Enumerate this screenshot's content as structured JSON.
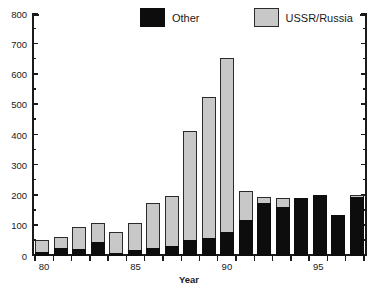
{
  "chart_data": {
    "type": "bar",
    "stacked": true,
    "title": "",
    "subtitle": "",
    "xlabel": "Year",
    "ylabel": "",
    "ylim": [
      0,
      800
    ],
    "ytick_step": 100,
    "yminor_step": 50,
    "grid": false,
    "legend_position": "top-center",
    "categories": [
      "80",
      "81",
      "82",
      "83",
      "84",
      "85",
      "86",
      "87",
      "88",
      "89",
      "90",
      "91",
      "92",
      "93",
      "94",
      "95",
      "96",
      "97"
    ],
    "xtick_labels": [
      "80",
      "85",
      "90",
      "95"
    ],
    "ytick_labels": [
      "0",
      "100",
      "200",
      "300",
      "400",
      "500",
      "600",
      "700",
      "800"
    ],
    "series": [
      {
        "name": "Other",
        "color": "#0d0d0d",
        "values": [
          12,
          27,
          22,
          47,
          10,
          20,
          26,
          32,
          53,
          58,
          81,
          118,
          175,
          163,
          193,
          203,
          135,
          196
        ]
      },
      {
        "name": "USSR/Russia",
        "color": "#c8c8c8",
        "values": [
          40,
          37,
          75,
          63,
          68,
          89,
          149,
          168,
          360,
          467,
          575,
          98,
          20,
          28,
          0,
          0,
          0,
          3
        ]
      }
    ],
    "totals": [
      52,
      64,
      97,
      110,
      78,
      109,
      175,
      200,
      413,
      525,
      656,
      216,
      195,
      191,
      193,
      203,
      135,
      199
    ]
  },
  "legend": {
    "items": [
      {
        "label": "Other",
        "swatch": "black-swatch"
      },
      {
        "label": "USSR/Russia",
        "swatch": "gray-swatch"
      }
    ]
  },
  "axes": {
    "x_title": "Year"
  }
}
